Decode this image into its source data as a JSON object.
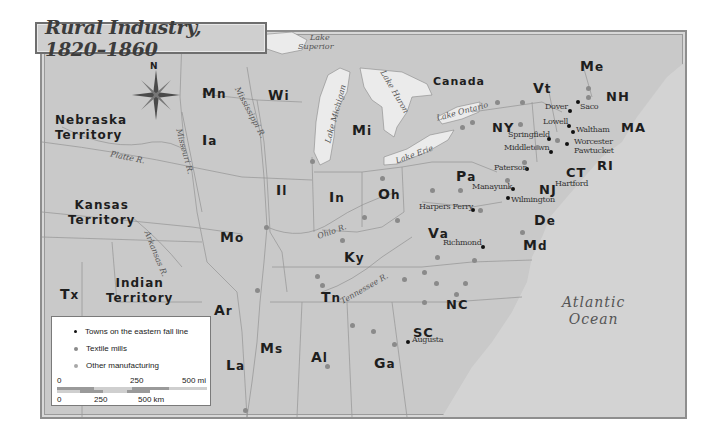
{
  "title": "Rural Industry, 1820–1860",
  "colors": {
    "land": "#c9c9c9",
    "water": "#ebebeb",
    "border": "#9a9a9a",
    "textile_mill": "#8a8a8a",
    "other_manufacturing": "#9c9c9c",
    "fall_line_town": "#111111"
  },
  "compass": {
    "label": "N"
  },
  "regions": [
    {
      "id": "nebraska",
      "line1": "Nebraska",
      "line2": "Territory"
    },
    {
      "id": "kansas",
      "line1": "Kansas",
      "line2": "Territory"
    },
    {
      "id": "indian",
      "line1": "Indian",
      "line2": "Territory"
    },
    {
      "id": "canada",
      "label": "Canada"
    }
  ],
  "states": {
    "mn": "Mn",
    "wi": "Wi",
    "ia": "Ia",
    "mi": "Mi",
    "il": "Il",
    "in": "In",
    "oh": "Oh",
    "mo": "Mo",
    "ky": "Ky",
    "tn": "Tn",
    "ar": "Ar",
    "tx": "Tx",
    "la": "La",
    "ms": "Ms",
    "al": "Al",
    "ga": "Ga",
    "sc": "SC",
    "nc": "NC",
    "va": "Va",
    "md": "Md",
    "de": "De",
    "nj": "NJ",
    "pa": "Pa",
    "ny": "NY",
    "ct": "CT",
    "ri": "RI",
    "ma": "MA",
    "nh": "NH",
    "vt": "Vt",
    "me": "Me"
  },
  "water_labels": {
    "lake_superior_1": "Lake",
    "lake_superior_2": "Superior",
    "lake_michigan": "Lake Michigan",
    "lake_huron": "Lake Huron",
    "lake_ontario": "Lake Ontario",
    "lake_erie": "Lake Erie",
    "mississippi": "Mississippi R.",
    "missouri": "Missouri R.",
    "platte": "Platte R.",
    "arkansas": "Arkansas R.",
    "ohio": "Ohio R.",
    "tennessee": "Tennessee R.",
    "ocean_1": "Atlantic",
    "ocean_2": "Ocean"
  },
  "fall_line_towns": [
    "Dover",
    "Saco",
    "Lowell",
    "Waltham",
    "Springfield",
    "Worcester",
    "Pawtucket",
    "Middletown",
    "Hartford",
    "Paterson",
    "Manayunk",
    "Wilmington",
    "Harpers Ferry",
    "Richmond",
    "Augusta"
  ],
  "legend": {
    "items": [
      {
        "label": "Towns on the eastern fall line",
        "color": "#111111"
      },
      {
        "label": "Textile mills",
        "color": "#8a8a8a"
      },
      {
        "label": "Other manufacturing",
        "color": "#9c9c9c"
      }
    ],
    "scale_mi": {
      "start": "0",
      "mid": "250",
      "end": "500 mi"
    },
    "scale_km": {
      "start": "0",
      "mid": "250",
      "end": "500 km"
    }
  }
}
